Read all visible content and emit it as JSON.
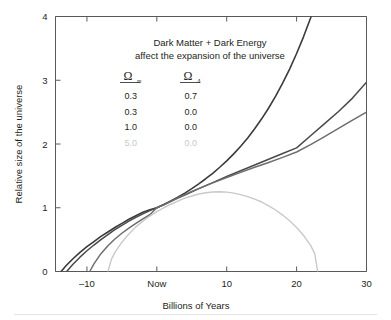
{
  "chart_data": {
    "type": "line",
    "title": "Dark Matter + Dark Energy affect the expansion of the universe",
    "title_line1": "Dark Matter + Dark Energy",
    "title_line2": "affect the expansion of the universe",
    "xlabel": "Billions of Years",
    "ylabel": "Relative size of the universe",
    "xlim": [
      -14.5,
      30
    ],
    "ylim": [
      0,
      4
    ],
    "grid": false,
    "legend_position": "inside-top-center",
    "xticks": [
      {
        "value": -10,
        "label": "–10"
      },
      {
        "value": 0,
        "label": "Now"
      },
      {
        "value": 10,
        "label": "10"
      },
      {
        "value": 20,
        "label": "20"
      },
      {
        "value": 30,
        "label": "30"
      }
    ],
    "yticks": [
      {
        "value": 0,
        "label": "0"
      },
      {
        "value": 1,
        "label": "1"
      },
      {
        "value": 2,
        "label": "2"
      },
      {
        "value": 3,
        "label": "3"
      },
      {
        "value": 4,
        "label": "4"
      }
    ],
    "legend_headers": {
      "omega_m": "Ω",
      "omega_m_sub": "m",
      "omega_lambda": "Ω",
      "omega_lambda_sub": "Λ"
    },
    "series": [
      {
        "name": "accelerating",
        "omega_m": "0.3",
        "omega_lambda": "0.7",
        "color": "#3b3b3b",
        "width": 1.6,
        "points": [
          [
            -13.7,
            0.0
          ],
          [
            -13.0,
            0.09
          ],
          [
            -12.0,
            0.2
          ],
          [
            -11.0,
            0.3
          ],
          [
            -10.0,
            0.39
          ],
          [
            -9.0,
            0.47
          ],
          [
            -8.0,
            0.55
          ],
          [
            -7.0,
            0.62
          ],
          [
            -6.0,
            0.69
          ],
          [
            -5.0,
            0.755
          ],
          [
            -4.0,
            0.82
          ],
          [
            -3.0,
            0.875
          ],
          [
            -2.0,
            0.93
          ],
          [
            -1.0,
            0.97
          ],
          [
            0.0,
            1.0
          ],
          [
            1.0,
            1.05
          ],
          [
            2.0,
            1.105
          ],
          [
            3.0,
            1.165
          ],
          [
            4.0,
            1.23
          ],
          [
            5.0,
            1.3
          ],
          [
            6.0,
            1.375
          ],
          [
            7.0,
            1.455
          ],
          [
            8.0,
            1.54
          ],
          [
            9.0,
            1.635
          ],
          [
            10.0,
            1.735
          ],
          [
            11.0,
            1.845
          ],
          [
            12.0,
            1.965
          ],
          [
            13.0,
            2.095
          ],
          [
            14.0,
            2.24
          ],
          [
            15.0,
            2.395
          ],
          [
            16.0,
            2.565
          ],
          [
            17.0,
            2.75
          ],
          [
            18.0,
            2.955
          ],
          [
            19.0,
            3.175
          ],
          [
            20.0,
            3.42
          ],
          [
            21.0,
            3.685
          ],
          [
            22.0,
            3.975
          ],
          [
            22.8,
            4.23
          ]
        ]
      },
      {
        "name": "open-low-density",
        "omega_m": "0.3",
        "omega_lambda": "0.0",
        "color": "#4a4a4a",
        "width": 1.5,
        "points": [
          [
            -12.9,
            0.0
          ],
          [
            -12.0,
            0.115
          ],
          [
            -11.0,
            0.225
          ],
          [
            -10.0,
            0.325
          ],
          [
            -9.0,
            0.415
          ],
          [
            -8.0,
            0.5
          ],
          [
            -7.0,
            0.58
          ],
          [
            -6.0,
            0.655
          ],
          [
            -5.0,
            0.725
          ],
          [
            -4.0,
            0.79
          ],
          [
            -3.0,
            0.85
          ],
          [
            -2.0,
            0.905
          ],
          [
            -1.0,
            0.955
          ],
          [
            0.0,
            1.0
          ],
          [
            1.0,
            1.05
          ],
          [
            2.0,
            1.1
          ],
          [
            3.0,
            1.15
          ],
          [
            4.0,
            1.2
          ],
          [
            5.0,
            1.25
          ],
          [
            6.0,
            1.3
          ],
          [
            8.0,
            1.395
          ],
          [
            10.0,
            1.49
          ],
          [
            12.0,
            1.58
          ],
          [
            14.0,
            1.67
          ],
          [
            16.0,
            1.76
          ],
          [
            18.0,
            1.85
          ],
          [
            20.0,
            1.94
          ],
          [
            22.0,
            2.13
          ],
          [
            24.0,
            2.32
          ],
          [
            26.0,
            2.51
          ],
          [
            28.0,
            2.72
          ],
          [
            30.0,
            2.97
          ]
        ]
      },
      {
        "name": "critical-density",
        "omega_m": "1.0",
        "omega_lambda": "0.0",
        "color": "#6d6e71",
        "width": 1.5,
        "points": [
          [
            -9.6,
            0.0
          ],
          [
            -9.0,
            0.12
          ],
          [
            -8.0,
            0.28
          ],
          [
            -7.0,
            0.405
          ],
          [
            -6.0,
            0.51
          ],
          [
            -5.0,
            0.6
          ],
          [
            -4.0,
            0.68
          ],
          [
            -3.0,
            0.755
          ],
          [
            -2.0,
            0.825
          ],
          [
            -1.0,
            0.89
          ],
          [
            0.0,
            1.0
          ],
          [
            1.0,
            1.045
          ],
          [
            2.0,
            1.1
          ],
          [
            3.0,
            1.155
          ],
          [
            4.0,
            1.205
          ],
          [
            5.0,
            1.255
          ],
          [
            6.0,
            1.3
          ],
          [
            8.0,
            1.39
          ],
          [
            10.0,
            1.475
          ],
          [
            12.0,
            1.555
          ],
          [
            14.0,
            1.635
          ],
          [
            16.0,
            1.71
          ],
          [
            18.0,
            1.79
          ],
          [
            20.0,
            1.875
          ],
          [
            22.0,
            1.99
          ],
          [
            24.0,
            2.115
          ],
          [
            26.0,
            2.245
          ],
          [
            28.0,
            2.375
          ],
          [
            30.0,
            2.5
          ]
        ]
      },
      {
        "name": "recollapsing",
        "omega_m": "5.0",
        "omega_lambda": "0.0",
        "color": "#c8c9ca",
        "width": 1.4,
        "points": [
          [
            -7.0,
            0.0
          ],
          [
            -6.5,
            0.19
          ],
          [
            -6.0,
            0.3
          ],
          [
            -5.0,
            0.46
          ],
          [
            -4.0,
            0.59
          ],
          [
            -3.0,
            0.7
          ],
          [
            -2.0,
            0.79
          ],
          [
            -1.0,
            0.87
          ],
          [
            0.0,
            0.94
          ],
          [
            1.0,
            1.0
          ],
          [
            2.0,
            1.055
          ],
          [
            3.0,
            1.105
          ],
          [
            4.0,
            1.15
          ],
          [
            5.0,
            1.185
          ],
          [
            6.0,
            1.215
          ],
          [
            7.0,
            1.235
          ],
          [
            8.0,
            1.248
          ],
          [
            9.0,
            1.25
          ],
          [
            10.0,
            1.245
          ],
          [
            11.0,
            1.23
          ],
          [
            12.0,
            1.205
          ],
          [
            13.0,
            1.175
          ],
          [
            14.0,
            1.135
          ],
          [
            15.0,
            1.09
          ],
          [
            16.0,
            1.03
          ],
          [
            17.0,
            0.965
          ],
          [
            18.0,
            0.885
          ],
          [
            19.0,
            0.795
          ],
          [
            20.0,
            0.69
          ],
          [
            21.0,
            0.565
          ],
          [
            22.0,
            0.41
          ],
          [
            22.6,
            0.28
          ],
          [
            23.0,
            0.0
          ]
        ]
      }
    ]
  }
}
